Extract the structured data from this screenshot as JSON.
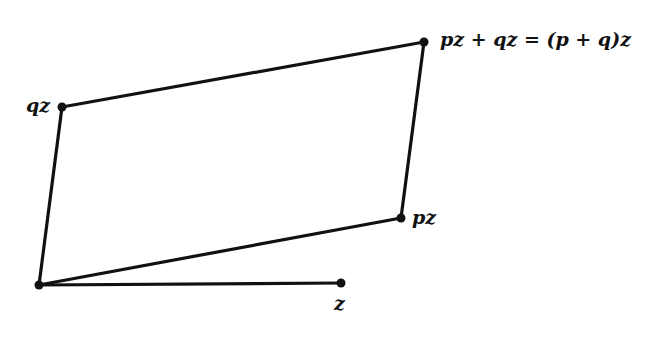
{
  "diagram": {
    "points": {
      "origin": {
        "x": 39,
        "y": 285
      },
      "z": {
        "x": 341,
        "y": 283
      },
      "pz": {
        "x": 401,
        "y": 218
      },
      "qz": {
        "x": 62,
        "y": 107
      },
      "sum": {
        "x": 424,
        "y": 42
      }
    },
    "labels": {
      "z": "z",
      "pz": "pz",
      "qz": "qz",
      "sum": "pz + qz = (p + q)z"
    },
    "stroke_color": "#111111"
  }
}
